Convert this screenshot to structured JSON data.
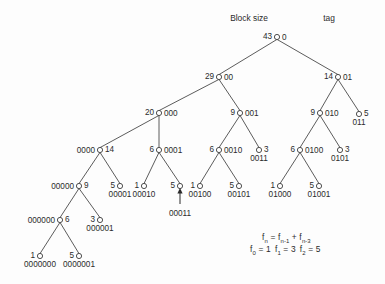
{
  "figure": {
    "headers": {
      "block_size_label": "Block size",
      "tag_label": "tag"
    },
    "formula": {
      "line1_prefix": "f",
      "line1_sub_n": "n",
      "line1_eq": " = f",
      "line1_sub_n1": "n-1",
      "line1_plus": " + f",
      "line1_sub_n3": "n-3",
      "line2_f0": "f",
      "line2_sub0": "0",
      "line2_val0": " = 1",
      "line2_f1": "f",
      "line2_sub1": "1",
      "line2_val1": " = 3",
      "line2_f2": "f",
      "line2_sub2": "2",
      "line2_val2": " = 5"
    },
    "annotation": {
      "pointer_target_tag": "00011"
    }
  },
  "tree": {
    "type": "binary-tree",
    "node_value_label": "Block size",
    "node_tag_label": "tag",
    "nodes": [
      {
        "id": "root",
        "size": "43",
        "tag": "0",
        "x": 277,
        "y": 37,
        "size_pos": "left",
        "tag_pos": "right"
      },
      {
        "id": "00",
        "size": "29",
        "tag": "00",
        "x": 219,
        "y": 77,
        "size_pos": "left",
        "tag_pos": "right"
      },
      {
        "id": "01",
        "size": "14",
        "tag": "01",
        "x": 338,
        "y": 77,
        "size_pos": "left",
        "tag_pos": "right"
      },
      {
        "id": "000",
        "size": "20",
        "tag": "000",
        "x": 159,
        "y": 113,
        "size_pos": "left",
        "tag_pos": "right"
      },
      {
        "id": "001",
        "size": "9",
        "tag": "001",
        "x": 240,
        "y": 113,
        "size_pos": "left",
        "tag_pos": "right"
      },
      {
        "id": "010",
        "size": "9",
        "tag": "010",
        "x": 320,
        "y": 113,
        "size_pos": "left",
        "tag_pos": "right"
      },
      {
        "id": "011",
        "size": "5",
        "tag": "011",
        "x": 359,
        "y": 114,
        "size_pos": "right-val",
        "tag_pos": "below"
      },
      {
        "id": "0000",
        "size": "14",
        "tag": "0000",
        "x": 100,
        "y": 150,
        "size_pos": "right",
        "tag_pos": "left"
      },
      {
        "id": "0001",
        "size": "6",
        "tag": "0001",
        "x": 159,
        "y": 150,
        "size_pos": "left",
        "tag_pos": "right"
      },
      {
        "id": "0010",
        "size": "6",
        "tag": "0010",
        "x": 219,
        "y": 150,
        "size_pos": "left",
        "tag_pos": "right"
      },
      {
        "id": "0011",
        "size": "3",
        "tag": "0011",
        "x": 259,
        "y": 150,
        "size_pos": "right-val",
        "tag_pos": "below"
      },
      {
        "id": "0100",
        "size": "6",
        "tag": "0100",
        "x": 300,
        "y": 150,
        "size_pos": "left",
        "tag_pos": "right"
      },
      {
        "id": "0101",
        "size": "3",
        "tag": "0101",
        "x": 340,
        "y": 150,
        "size_pos": "right-val",
        "tag_pos": "below"
      },
      {
        "id": "00000",
        "size": "9",
        "tag": "00000",
        "x": 79,
        "y": 186,
        "size_pos": "right",
        "tag_pos": "left"
      },
      {
        "id": "00001",
        "size": "5",
        "tag": "00001",
        "x": 120,
        "y": 186,
        "size_pos": "left",
        "tag_pos": "below"
      },
      {
        "id": "00010",
        "size": "1",
        "tag": "00010",
        "x": 144,
        "y": 186,
        "size_pos": "left",
        "tag_pos": "below"
      },
      {
        "id": "00011",
        "size": "5",
        "tag": "00011",
        "x": 180,
        "y": 186,
        "size_pos": "left",
        "tag_pos": "below-far"
      },
      {
        "id": "00100",
        "size": "1",
        "tag": "00100",
        "x": 200,
        "y": 186,
        "size_pos": "left",
        "tag_pos": "below"
      },
      {
        "id": "00101",
        "size": "5",
        "tag": "00101",
        "x": 239,
        "y": 186,
        "size_pos": "left",
        "tag_pos": "below"
      },
      {
        "id": "01000",
        "size": "1",
        "tag": "01000",
        "x": 280,
        "y": 186,
        "size_pos": "left",
        "tag_pos": "below"
      },
      {
        "id": "01001",
        "size": "5",
        "tag": "01001",
        "x": 319,
        "y": 186,
        "size_pos": "left",
        "tag_pos": "below"
      },
      {
        "id": "000000",
        "size": "6",
        "tag": "000000",
        "x": 60,
        "y": 220,
        "size_pos": "right",
        "tag_pos": "left"
      },
      {
        "id": "000001",
        "size": "3",
        "tag": "000001",
        "x": 100,
        "y": 220,
        "size_pos": "left",
        "tag_pos": "below"
      },
      {
        "id": "0000000",
        "size": "1",
        "tag": "0000000",
        "x": 40,
        "y": 256,
        "size_pos": "left",
        "tag_pos": "below"
      },
      {
        "id": "0000001",
        "size": "5",
        "tag": "0000001",
        "x": 79,
        "y": 256,
        "size_pos": "left",
        "tag_pos": "below"
      }
    ],
    "edges": [
      [
        "root",
        "00"
      ],
      [
        "root",
        "01"
      ],
      [
        "00",
        "000"
      ],
      [
        "00",
        "001"
      ],
      [
        "01",
        "010"
      ],
      [
        "01",
        "011"
      ],
      [
        "000",
        "0000"
      ],
      [
        "000",
        "0001"
      ],
      [
        "001",
        "0010"
      ],
      [
        "001",
        "0011"
      ],
      [
        "010",
        "0100"
      ],
      [
        "010",
        "0101"
      ],
      [
        "0000",
        "00000"
      ],
      [
        "0000",
        "00001"
      ],
      [
        "0001",
        "00010"
      ],
      [
        "0001",
        "00011"
      ],
      [
        "0010",
        "00100"
      ],
      [
        "0010",
        "00101"
      ],
      [
        "0100",
        "01000"
      ],
      [
        "0100",
        "01001"
      ],
      [
        "00000",
        "000000"
      ],
      [
        "00000",
        "000001"
      ],
      [
        "000000",
        "0000000"
      ],
      [
        "000000",
        "0000001"
      ]
    ]
  }
}
